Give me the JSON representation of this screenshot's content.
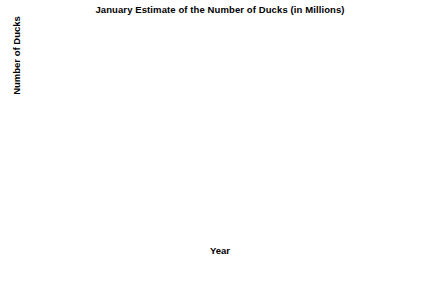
{
  "chart_data": {
    "type": "line",
    "title": "January Estimate of the Number of Ducks (in Millions)",
    "xlabel": "Year",
    "ylabel": "Number of Ducks",
    "xlim": [
      1955,
      1980
    ],
    "ylim": [
      0,
      25
    ],
    "xticks": [
      1955,
      1960,
      1965,
      1970,
      1975,
      1980
    ],
    "yticks": [
      0,
      5,
      10,
      15,
      20,
      25
    ],
    "xtick_labels": [
      "1955",
      "1960",
      "1965",
      "1970",
      "1975",
      "1980"
    ],
    "ytick_labels": [
      "0",
      "5",
      "10",
      "15",
      "20",
      "25"
    ],
    "grid": false,
    "legend": false,
    "marker": "square",
    "line_color": "#000000",
    "marker_color": "#000000",
    "frame_color": "#b0b0b0",
    "axis_color": "#000000",
    "x": [
      1955,
      1956,
      1957,
      1958,
      1959,
      1960,
      1961,
      1962,
      1963,
      1964,
      1965,
      1966,
      1967,
      1968,
      1969,
      1970,
      1971,
      1972,
      1973,
      1974,
      1975,
      1976,
      1977,
      1978,
      1979
    ],
    "values": [
      19.0,
      22.7,
      17.7,
      22.9,
      22.0,
      19.2,
      19.8,
      17.4,
      20.3,
      23.6,
      20.1,
      20.1,
      20.9,
      17.5,
      17.6,
      22.4,
      22.8,
      22.4,
      20.6,
      19.0,
      20.9,
      23.3,
      22.0,
      17.4,
      20.6
    ],
    "series": [
      {
        "name": "January duck estimate",
        "values": [
          19.0,
          22.7,
          17.7,
          22.9,
          22.0,
          19.2,
          19.8,
          17.4,
          20.3,
          23.6,
          20.1,
          20.1,
          20.9,
          17.5,
          17.6,
          22.4,
          22.8,
          22.4,
          20.6,
          19.0,
          20.9,
          23.3,
          22.0,
          17.4,
          20.6
        ]
      }
    ]
  }
}
